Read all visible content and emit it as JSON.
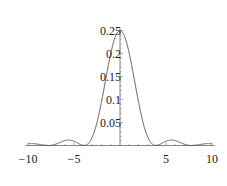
{
  "chart_data": {
    "type": "line",
    "title": "",
    "xlabel": "",
    "ylabel": "",
    "xlim": [
      -10,
      10
    ],
    "ylim": [
      0,
      0.25
    ],
    "grid": false,
    "legend": null,
    "x_ticks": [
      "-10",
      "-5",
      "5",
      "10"
    ],
    "y_ticks": [
      "0.05",
      "0.1",
      "0.15",
      "0.2",
      "0.25"
    ],
    "series": [
      {
        "name": "curve",
        "color": "#555555",
        "x": [
          -10,
          -9,
          -8,
          -7,
          -6,
          -5.5,
          -5,
          -4.5,
          -4,
          -3.5,
          -3,
          -2.5,
          -2,
          -1.5,
          -1,
          -0.5,
          0,
          0.5,
          1,
          1.5,
          2,
          2.5,
          3,
          3.5,
          4,
          4.5,
          5,
          5.5,
          6,
          7,
          8,
          9,
          10
        ],
        "y": [
          0.002,
          0.001,
          0.0,
          0.002,
          0.004,
          0.005,
          0.004,
          0.002,
          0.0,
          0.008,
          0.028,
          0.06,
          0.101,
          0.146,
          0.19,
          0.228,
          0.25,
          0.228,
          0.19,
          0.146,
          0.101,
          0.06,
          0.028,
          0.008,
          0.0,
          0.002,
          0.004,
          0.005,
          0.004,
          0.002,
          0.0,
          0.001,
          0.002
        ]
      }
    ]
  },
  "axes": {
    "x_labels": [
      {
        "value": -10,
        "text": "−10"
      },
      {
        "value": -5,
        "text": "−5"
      },
      {
        "value": 5,
        "text": "5"
      },
      {
        "value": 10,
        "text": "10"
      }
    ],
    "y_labels": [
      {
        "value": 0.05,
        "text": "0.05"
      },
      {
        "value": 0.1,
        "text": "0.1"
      },
      {
        "value": 0.15,
        "text": "0.15"
      },
      {
        "value": 0.2,
        "text": "0.2"
      },
      {
        "value": 0.25,
        "text": "0.25"
      }
    ]
  }
}
